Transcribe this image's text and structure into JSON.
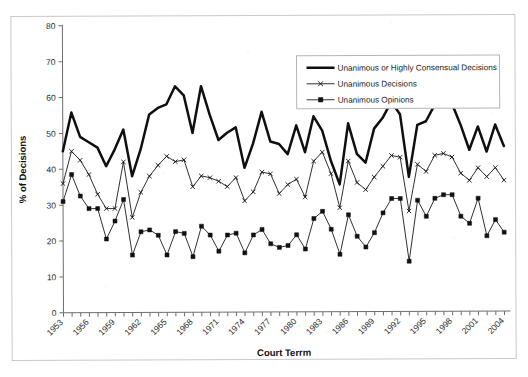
{
  "figure": {
    "frame_visible": true,
    "background": "#ffffff",
    "ink_color": "#111111"
  },
  "chart_data": {
    "type": "line",
    "title": "",
    "subtitle": "",
    "xlabel": "Court Terrm",
    "ylabel": "% of Decisions",
    "ylim": [
      0,
      80
    ],
    "ytick_step": 10,
    "yticks": [
      0,
      10,
      20,
      30,
      40,
      50,
      60,
      70,
      80
    ],
    "grid": false,
    "legend_position": "top-right-inside",
    "xlabel_rotation": -45,
    "xtick_label_interval": 3,
    "x": [
      1953,
      1954,
      1955,
      1956,
      1957,
      1958,
      1959,
      1960,
      1961,
      1962,
      1963,
      1964,
      1965,
      1966,
      1967,
      1968,
      1969,
      1970,
      1971,
      1972,
      1973,
      1974,
      1975,
      1976,
      1977,
      1978,
      1979,
      1980,
      1981,
      1982,
      1983,
      1984,
      1985,
      1986,
      1987,
      1988,
      1989,
      1990,
      1991,
      1992,
      1993,
      1994,
      1995,
      1996,
      1997,
      1998,
      1999,
      2000,
      2001,
      2002,
      2003,
      2004
    ],
    "xtick_labels": [
      "1953",
      "1956",
      "1959",
      "1962",
      "1965",
      "1968",
      "1971",
      "1974",
      "1977",
      "1980",
      "1983",
      "1986",
      "1989",
      "1992",
      "1995",
      "1998",
      "2001",
      "2004"
    ],
    "series": [
      {
        "name": "Unanimous or Highly Consensual Decisions",
        "marker": "none",
        "line_style": "thick-solid",
        "color": "#0f0f0f",
        "values": [
          45.0,
          55.8,
          49.0,
          47.5,
          46.0,
          40.8,
          45.5,
          51.0,
          38.0,
          45.5,
          55.2,
          57.0,
          58.0,
          63.0,
          60.5,
          50.0,
          63.0,
          55.0,
          48.0,
          50.0,
          51.5,
          40.2,
          47.0,
          55.8,
          47.5,
          46.8,
          44.0,
          52.0,
          44.5,
          54.5,
          50.5,
          42.0,
          35.5,
          52.5,
          44.0,
          41.5,
          51.0,
          54.0,
          58.5,
          55.0,
          37.5,
          52.0,
          53.0,
          57.5,
          58.5,
          58.0,
          52.0,
          45.0,
          51.5,
          44.5,
          52.0,
          46.0
        ]
      },
      {
        "name": "Unanimous Decisions",
        "marker": "x",
        "line_style": "thin-solid",
        "color": "#1a1a1a",
        "values": [
          36.0,
          45.0,
          42.5,
          38.5,
          33.0,
          29.0,
          29.0,
          42.0,
          26.5,
          33.5,
          38.0,
          41.0,
          43.5,
          42.0,
          42.5,
          35.0,
          38.0,
          37.5,
          36.5,
          35.0,
          37.5,
          31.0,
          33.5,
          39.0,
          38.5,
          33.0,
          35.5,
          37.0,
          32.0,
          42.0,
          44.5,
          38.5,
          29.0,
          42.0,
          36.0,
          34.0,
          37.5,
          40.5,
          43.5,
          43.0,
          28.0,
          41.0,
          39.0,
          43.5,
          44.0,
          43.0,
          38.5,
          36.5,
          40.0,
          37.5,
          40.0,
          36.5
        ]
      },
      {
        "name": "Unanimous Opinions",
        "marker": "square",
        "line_style": "thin-solid",
        "color": "#1a1a1a",
        "values": [
          31.0,
          38.5,
          32.5,
          29.0,
          29.0,
          20.5,
          25.5,
          31.5,
          16.0,
          22.5,
          23.0,
          21.5,
          16.0,
          22.5,
          22.0,
          15.5,
          24.0,
          21.5,
          17.0,
          21.5,
          22.0,
          16.5,
          21.5,
          23.0,
          19.0,
          18.0,
          18.5,
          21.5,
          17.5,
          26.0,
          28.0,
          23.0,
          16.0,
          27.0,
          21.0,
          18.0,
          22.0,
          27.5,
          31.5,
          31.5,
          14.0,
          31.0,
          26.5,
          31.5,
          32.5,
          32.5,
          26.5,
          24.5,
          31.5,
          21.0,
          25.5,
          22.0
        ]
      }
    ]
  },
  "legend": {
    "entries": [
      {
        "label": "Unanimous or Highly Consensual Decisions",
        "marker": "none"
      },
      {
        "label": "Unanimous Decisions",
        "marker": "x"
      },
      {
        "label": "Unanimous Opinions",
        "marker": "square"
      }
    ]
  }
}
